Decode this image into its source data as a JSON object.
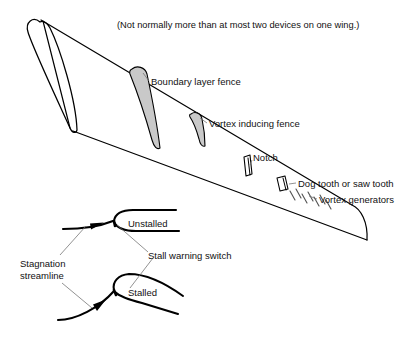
{
  "figure": {
    "title_note": "(Not normally more than at most two devices on one wing.)",
    "background_color": "#ffffff",
    "ink_color": "#000000",
    "fence_fill_color": "#c9c9c9",
    "leader_color": "#6e6e6e"
  },
  "wing_labels": {
    "boundary_layer_fence": "Boundary layer fence",
    "vortex_inducing_fence": "Vortex inducing fence",
    "notch": "Notch",
    "dog_tooth": "Dog tooth or saw tooth",
    "vortex_generators": "Vortex generators"
  },
  "section_labels": {
    "unstalled": "Unstalled",
    "stalled": "Stalled",
    "stall_warning_switch": "Stall warning switch",
    "stagnation_line_1": "Stagnation",
    "stagnation_line_2": "streamline"
  },
  "devices": [
    {
      "name": "boundary-layer-fence",
      "type": "fence",
      "filled": true
    },
    {
      "name": "vortex-inducing-fence",
      "type": "fence",
      "filled": true
    },
    {
      "name": "notch",
      "type": "slot",
      "filled": false
    },
    {
      "name": "dog-tooth",
      "type": "slot",
      "filled": false
    },
    {
      "name": "vortex-generators",
      "type": "vane-array",
      "count": 7
    }
  ]
}
